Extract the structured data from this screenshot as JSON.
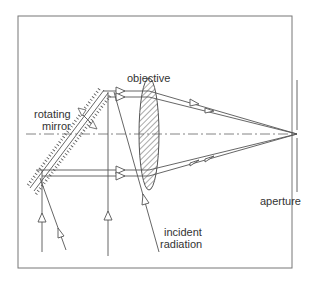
{
  "diagram": {
    "labels": {
      "objective": "objective",
      "rotating": "rotating",
      "mirror": "mirror",
      "incident": "incident",
      "radiation": "radiation",
      "aperture": "aperture"
    },
    "colors": {
      "line": "#555555",
      "frame": "#777777",
      "text": "#333333"
    }
  }
}
